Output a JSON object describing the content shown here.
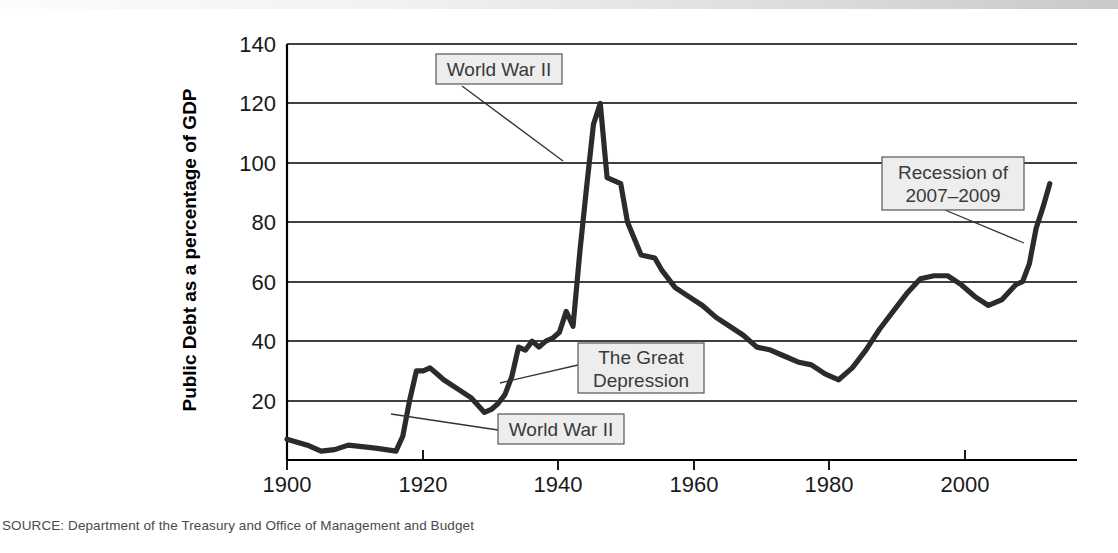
{
  "figure": {
    "source_note": "SOURCE: Department of the Treasury and Office of Management and Budget"
  },
  "chart_data": {
    "type": "line",
    "title": "",
    "xlabel": "Year",
    "ylabel": "Public Debt as a percentage of GDP",
    "xlim": [
      1900,
      2016
    ],
    "ylim": [
      0,
      140
    ],
    "grid": true,
    "legend": "none",
    "xticks": [
      1900,
      1920,
      1940,
      1960,
      1980,
      2000
    ],
    "xtick_labels": [
      "1900",
      "1920",
      "1940",
      "1960",
      "1980",
      "2000"
    ],
    "yticks": [
      20,
      40,
      60,
      80,
      100,
      120,
      140
    ],
    "ytick_labels": [
      "20",
      "40",
      "60",
      "80",
      "100",
      "120",
      "140"
    ],
    "series": [
      {
        "name": "Public Debt as a percentage of GDP",
        "color": "#2b2b2b",
        "x": [
          1900,
          1903,
          1905,
          1907,
          1909,
          1911,
          1913,
          1916,
          1917,
          1918,
          1919,
          1920,
          1921,
          1922,
          1923,
          1925,
          1927,
          1929,
          1930,
          1931,
          1932,
          1933,
          1934,
          1935,
          1936,
          1937,
          1938,
          1939,
          1940,
          1941,
          1942,
          1943,
          1944,
          1945,
          1946,
          1947,
          1948,
          1949,
          1950,
          1952,
          1954,
          1955,
          1957,
          1959,
          1961,
          1963,
          1965,
          1967,
          1969,
          1971,
          1973,
          1975,
          1977,
          1979,
          1981,
          1983,
          1985,
          1987,
          1989,
          1991,
          1993,
          1995,
          1997,
          1999,
          2001,
          2003,
          2005,
          2007,
          2008,
          2009,
          2010,
          2011,
          2012
        ],
        "y": [
          7,
          5,
          3,
          3.5,
          5,
          4.5,
          4,
          3,
          8,
          20,
          30,
          30,
          31,
          29,
          27,
          24,
          21,
          16,
          17,
          19,
          22,
          28,
          38,
          37,
          40,
          38,
          40,
          41,
          43,
          50,
          45,
          70,
          92,
          113,
          120,
          95,
          94,
          93,
          80,
          69,
          68,
          64,
          58,
          55,
          52,
          48,
          45,
          42,
          38,
          37,
          35,
          33,
          32,
          29,
          27,
          31,
          37,
          44,
          50,
          56,
          61,
          62,
          62,
          59,
          55,
          52,
          54,
          59,
          60,
          66,
          78,
          85,
          93
        ]
      }
    ],
    "annotations": [
      {
        "label": "World War II",
        "lines": [
          "World War II"
        ],
        "box_x": 436,
        "box_y": 54,
        "box_w": 126,
        "box_h": 30,
        "leader_from": [
          462,
          86
        ],
        "leader_to": [
          563,
          161
        ]
      },
      {
        "label": "The Great Depression",
        "lines": [
          "The Great",
          "Depression"
        ],
        "box_x": 578,
        "box_y": 343,
        "box_w": 126,
        "box_h": 50,
        "leader_from": [
          578,
          365
        ],
        "leader_to": [
          500,
          383
        ]
      },
      {
        "label": "World War II (lower)",
        "lines": [
          "World War II"
        ],
        "box_x": 498,
        "box_y": 414,
        "box_w": 126,
        "box_h": 30,
        "leader_from": [
          498,
          430
        ],
        "leader_to": [
          391,
          414
        ]
      },
      {
        "label": "Recession of 2007-2009",
        "lines": [
          "Recession of",
          "2007–2009"
        ],
        "box_x": 882,
        "box_y": 157,
        "box_w": 142,
        "box_h": 53,
        "leader_from": [
          945,
          210
        ],
        "leader_to": [
          1024,
          243
        ]
      }
    ]
  }
}
